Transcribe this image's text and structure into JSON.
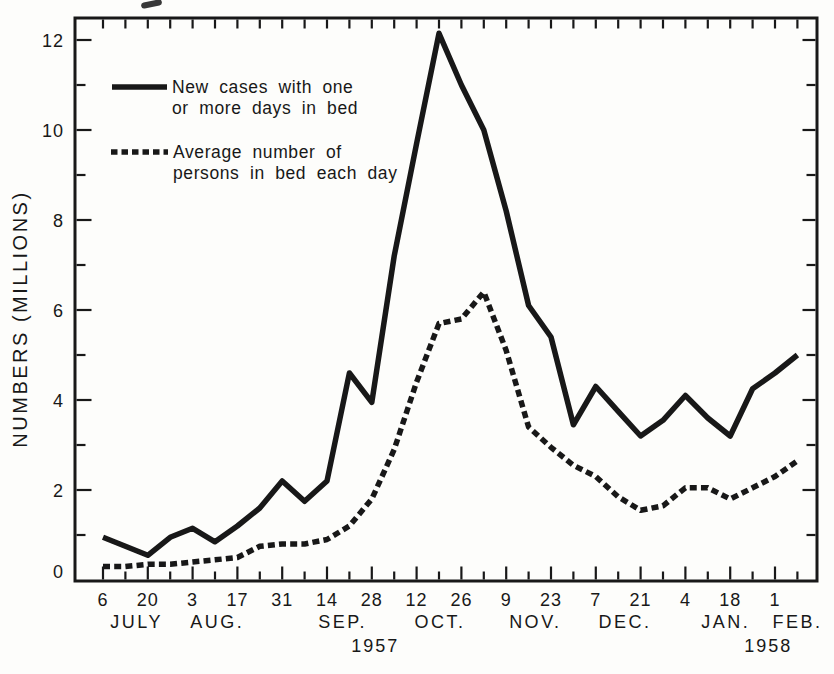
{
  "colors": {
    "ink": "#181818",
    "background": "#fdfdfb"
  },
  "axis": {
    "ylabel": "NUMBERS (MILLIONS)"
  },
  "legend": {
    "entries": [
      {
        "style": "solid",
        "label_line1": "New cases with one",
        "label_line2": "or more days in bed"
      },
      {
        "style": "dashed",
        "label_line1": "Average number of",
        "label_line2": "persons in bed each day"
      }
    ]
  },
  "chart_data": {
    "type": "line",
    "title": "",
    "xlabel": "",
    "ylabel": "NUMBERS (MILLIONS)",
    "ylim": [
      0,
      12.5
    ],
    "yticks": [
      0,
      2,
      4,
      6,
      8,
      10,
      12
    ],
    "grid": false,
    "legend_position": "inside-top-left",
    "x_unit": "week ending",
    "categories": [
      "Jul 6",
      "Jul 13",
      "Jul 20",
      "Jul 27",
      "Aug 3",
      "Aug 10",
      "Aug 17",
      "Aug 24",
      "Aug 31",
      "Sep 7",
      "Sep 14",
      "Sep 21",
      "Sep 28",
      "Oct 5",
      "Oct 12",
      "Oct 19",
      "Oct 26",
      "Nov 2",
      "Nov 9",
      "Nov 16",
      "Nov 23",
      "Nov 30",
      "Dec 7",
      "Dec 14",
      "Dec 21",
      "Dec 28",
      "Jan 4",
      "Jan 11",
      "Jan 18",
      "Jan 25",
      "Feb 1",
      "Feb 8"
    ],
    "x_tick_labels": [
      "6",
      "",
      "20",
      "",
      "3",
      "",
      "17",
      "",
      "31",
      "",
      "14",
      "",
      "28",
      "",
      "12",
      "",
      "26",
      "",
      "9",
      "",
      "23",
      "",
      "7",
      "",
      "21",
      "",
      "4",
      "",
      "18",
      "",
      "1",
      ""
    ],
    "month_labels": [
      {
        "text": "JULY",
        "week": 1.5
      },
      {
        "text": "AUG.",
        "week": 5.1
      },
      {
        "text": "SEP.",
        "week": 10.7
      },
      {
        "text": "OCT.",
        "week": 15.05
      },
      {
        "text": "NOV.",
        "week": 19.3
      },
      {
        "text": "DEC.",
        "week": 23.3
      },
      {
        "text": "JAN.",
        "week": 27.8
      },
      {
        "text": "FEB.",
        "week": 31.0
      }
    ],
    "year_labels": [
      {
        "text": "1957",
        "week": 12.15
      },
      {
        "text": "1958",
        "week": 29.7
      }
    ],
    "series": [
      {
        "name": "New cases with one or more days in bed",
        "line_style": "solid",
        "values": [
          0.95,
          0.75,
          0.55,
          0.95,
          1.15,
          0.85,
          1.2,
          1.6,
          2.2,
          1.75,
          2.2,
          4.6,
          3.95,
          7.2,
          9.7,
          12.15,
          11.0,
          10.0,
          8.2,
          6.1,
          5.4,
          3.45,
          4.3,
          3.75,
          3.2,
          3.55,
          4.1,
          3.6,
          3.2,
          4.25,
          4.6,
          5.0
        ]
      },
      {
        "name": "Average number of persons in bed each day",
        "line_style": "dashed",
        "values": [
          0.3,
          0.3,
          0.35,
          0.35,
          0.4,
          0.45,
          0.5,
          0.75,
          0.8,
          0.8,
          0.9,
          1.2,
          1.8,
          2.9,
          4.4,
          5.7,
          5.8,
          6.4,
          5.1,
          3.4,
          2.95,
          2.55,
          2.3,
          1.85,
          1.55,
          1.65,
          2.05,
          2.05,
          1.8,
          2.05,
          2.3,
          2.65
        ]
      }
    ]
  }
}
